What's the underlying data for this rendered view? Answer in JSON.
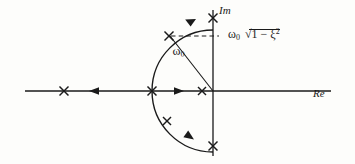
{
  "figure": {
    "axes": {
      "real_axis_label": "Re",
      "imag_axis_label": "Im",
      "origin": {
        "x": 213,
        "y": 91
      }
    },
    "labels": {
      "radius": {
        "omega": "ω",
        "subscript": "0"
      },
      "imag_value": {
        "omega": "ω",
        "subscript": "0",
        "radical_expr": "1 − ξ",
        "exponent": "2"
      }
    },
    "colors": {
      "ink": "#1a1a1a",
      "background": "#fdfdfb",
      "dashed": "#1a1a1a"
    },
    "circle": {
      "center_x": 213,
      "center_y": 91,
      "radius": 61
    },
    "poles": [
      {
        "name": "pole-real-far-left",
        "x": 64,
        "y": 91
      },
      {
        "name": "pole-real-circle-left",
        "x": 152,
        "y": 91
      },
      {
        "name": "pole-real-near-origin",
        "x": 202,
        "y": 91
      },
      {
        "name": "pole-upper-arc",
        "x": 169,
        "y": 36
      },
      {
        "name": "pole-imag-top",
        "x": 213,
        "y": 18
      },
      {
        "name": "pole-lower-arc",
        "x": 167,
        "y": 121
      },
      {
        "name": "pole-imag-bottom",
        "x": 213,
        "y": 146
      }
    ],
    "arrows": [
      {
        "name": "arrow-real-left",
        "x": 95,
        "y": 91,
        "dir": "left"
      },
      {
        "name": "arrow-real-right",
        "x": 178,
        "y": 91,
        "dir": "right"
      },
      {
        "name": "arrow-arc-upper",
        "x": 190,
        "y": 22,
        "dir": "up-right"
      },
      {
        "name": "arrow-arc-lower",
        "x": 188,
        "y": 136,
        "dir": "down-right"
      }
    ],
    "dashed_line": {
      "x1": 170,
      "y1": 36,
      "x2": 218,
      "y2": 36
    }
  }
}
